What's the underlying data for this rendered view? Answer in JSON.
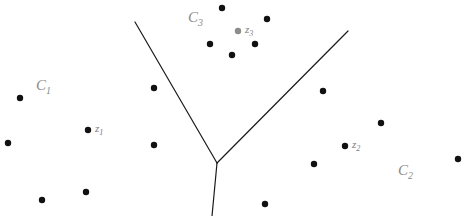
{
  "figure": {
    "width": 467,
    "height": 216,
    "background": "#ffffff",
    "caption": "Three clusters separated by boundary lines with centroids z1, z2, z3"
  },
  "chart_data": {
    "type": "scatter",
    "title": "",
    "xlabel": "",
    "ylabel": "",
    "xlim": [
      0,
      467
    ],
    "ylim": [
      0,
      216
    ],
    "grid": false,
    "legend": "none",
    "point_color": "#111111",
    "point_radius": 3.2,
    "centroid_colors": {
      "z1": "#111111",
      "z2": "#111111",
      "z3": "#8c8c8c"
    },
    "series": [
      {
        "name": "C1",
        "label": "C",
        "sub": "1",
        "label_x": 36,
        "label_y": 78,
        "points": [
          {
            "x": 20,
            "y": 98
          },
          {
            "x": 8,
            "y": 143
          },
          {
            "x": 42,
            "y": 200
          },
          {
            "x": 86,
            "y": 192
          },
          {
            "x": 154,
            "y": 88
          },
          {
            "x": 154,
            "y": 145
          }
        ]
      },
      {
        "name": "C2",
        "label": "C",
        "sub": "2",
        "label_x": 398,
        "label_y": 163,
        "points": [
          {
            "x": 323,
            "y": 91
          },
          {
            "x": 381,
            "y": 123
          },
          {
            "x": 458,
            "y": 159
          },
          {
            "x": 314,
            "y": 164
          },
          {
            "x": 265,
            "y": 204
          }
        ]
      },
      {
        "name": "C3",
        "label": "C",
        "sub": "3",
        "label_x": 188,
        "label_y": 10,
        "points": [
          {
            "x": 222,
            "y": 8
          },
          {
            "x": 267,
            "y": 19
          },
          {
            "x": 210,
            "y": 44
          },
          {
            "x": 255,
            "y": 44
          },
          {
            "x": 232,
            "y": 55
          }
        ]
      }
    ],
    "centroids": [
      {
        "name": "z1",
        "label": "z",
        "sub": "1",
        "x": 88,
        "y": 130,
        "color": "#111111",
        "label_x": 95,
        "label_y": 123
      },
      {
        "name": "z2",
        "label": "z",
        "sub": "2",
        "x": 345,
        "y": 146,
        "color": "#111111",
        "label_x": 352,
        "label_y": 139
      },
      {
        "name": "z3",
        "label": "z",
        "sub": "3",
        "x": 238,
        "y": 31,
        "color": "#8c8c8c",
        "label_x": 245,
        "label_y": 24
      }
    ],
    "boundaries": [
      {
        "name": "left-boundary",
        "x1": 135,
        "y1": 22,
        "x2": 217,
        "y2": 163
      },
      {
        "name": "right-boundary",
        "x1": 348,
        "y1": 31,
        "x2": 217,
        "y2": 163
      },
      {
        "name": "bottom-boundary",
        "x1": 217,
        "y1": 163,
        "x2": 212,
        "y2": 216
      }
    ],
    "boundary_color": "#1a1a1a",
    "boundary_width": 1.2
  }
}
